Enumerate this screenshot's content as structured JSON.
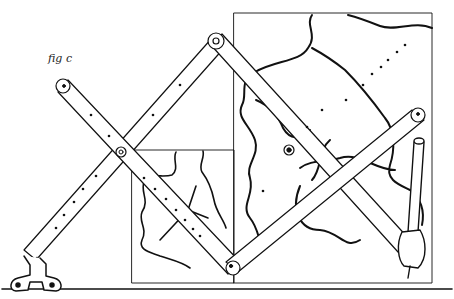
{
  "figure": {
    "caption": "fig c",
    "colors": {
      "ink": "#111111",
      "paper": "#ffffff"
    },
    "parts": {
      "anchor": "anchor-clamp",
      "small_frame": "original-drawing",
      "large_frame": "enlarged-drawing",
      "pen": "pencil-holder",
      "pivots": 4
    }
  }
}
